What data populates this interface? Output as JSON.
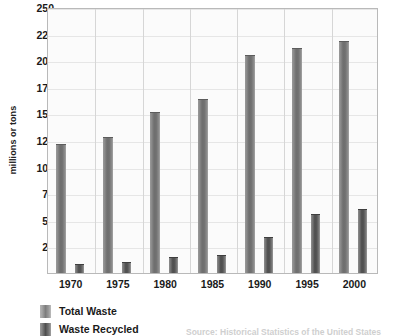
{
  "chart_data": {
    "type": "bar",
    "title": "",
    "xlabel": "",
    "ylabel": "millions or tons",
    "categories": [
      "1970",
      "1975",
      "1980",
      "1985",
      "1990",
      "1995",
      "2000"
    ],
    "series": [
      {
        "name": "Total Waste",
        "values": [
          121,
          128,
          151,
          164,
          205,
          211,
          218
        ]
      },
      {
        "name": "Waste Recycled",
        "values": [
          8,
          10,
          15,
          17,
          34,
          55,
          60
        ]
      }
    ],
    "ylim": [
      0,
      250
    ],
    "yticks": [
      25,
      50,
      75,
      100,
      125,
      150,
      175,
      200,
      225,
      250
    ],
    "grid": "horizontal-and-vertical",
    "legend_position": "bottom-left",
    "colors": {
      "total_waste": "#7d7d7d",
      "waste_recycled": "#4f4f4f",
      "grid": "#e6e6e6",
      "frame": "#b9b9b9",
      "plot_background": "#fbfbfb"
    },
    "annotations": [
      "Source: Historical Statistics of the United States"
    ]
  },
  "legend": {
    "items": [
      {
        "label": "Total Waste"
      },
      {
        "label": "Waste Recycled"
      }
    ]
  },
  "source": {
    "text": "Source: Historical Statistics of the United States"
  }
}
